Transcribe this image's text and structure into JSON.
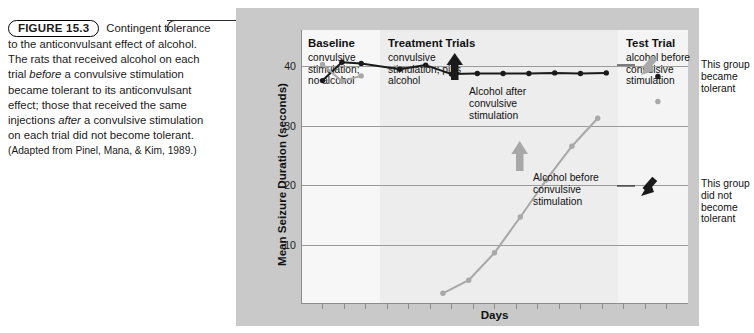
{
  "caption": {
    "figure_label": "FIGURE 15.3",
    "text_1": " Contingent tolerance to the anticonvulsant effect of alcohol. The rats that received alcohol on each trial ",
    "em_1": "before",
    "text_2": " a convulsive stimulation became tolerant to its anticonvulsant effect; those that received the same injections ",
    "em_2": "after",
    "text_3": " a convulsive stimulation on each trial did not become tolerant. ",
    "source": "(Adapted from Pinel, Mana, & Kim, 1989.)"
  },
  "columns": [
    {
      "heading": "Baseline",
      "subtext": "convulsive\nstimulation;\nno alcohol"
    },
    {
      "heading": "Treatment Trials",
      "subtext": "convulsive\nstimulation; plus\nalcohol"
    },
    {
      "heading": "Test Trial",
      "subtext": "alcohol before\nconvulsive\nstimulation"
    }
  ],
  "annotations": {
    "alcohol_after": "Alcohol after convulsive stimulation",
    "alcohol_before": "Alcohol before convulsive stimulation",
    "became_tolerant": "This group became tolerant",
    "not_tolerant": "This group did not become tolerant"
  },
  "colors": {
    "figure_background": "#c9c9c9",
    "panel_baseline": "#f7f7f7",
    "panel_treatment": "#ededed",
    "panel_test": "#f4f4f4",
    "series_after_stimulation": "#1a1a1a",
    "series_before_stimulation": "#a8a8a8",
    "gridline": "#9a9a9a",
    "axis": "#8c8c8c"
  },
  "chart_data": {
    "type": "line",
    "title": "",
    "xlabel": "Days",
    "ylabel": "Mean Seizure Duration (seconds)",
    "ylim": [
      0,
      46
    ],
    "yticks": [
      10,
      20,
      30,
      40
    ],
    "xlim": [
      0,
      18
    ],
    "grid": true,
    "legend": "none",
    "panels": [
      {
        "name": "Baseline",
        "x_start": 0,
        "x_end": 3.7
      },
      {
        "name": "Treatment Trials",
        "x_start": 3.7,
        "x_end": 14.8
      },
      {
        "name": "Test Trial",
        "x_start": 14.8,
        "x_end": 18
      }
    ],
    "series": [
      {
        "name": "Alcohol after convulsive stimulation",
        "color": "#1a1a1a",
        "marker": "circle",
        "points": [
          {
            "x": 1.0,
            "y": 37.5
          },
          {
            "x": 1.9,
            "y": 40.6
          },
          {
            "x": 2.8,
            "y": 40.4
          },
          {
            "x": 4.6,
            "y": 39.4
          },
          {
            "x": 5.8,
            "y": 40.1
          },
          {
            "x": 7.0,
            "y": 38.6
          },
          {
            "x": 8.2,
            "y": 38.7
          },
          {
            "x": 9.4,
            "y": 38.7
          },
          {
            "x": 10.6,
            "y": 38.7
          },
          {
            "x": 11.8,
            "y": 38.8
          },
          {
            "x": 13.0,
            "y": 38.7
          },
          {
            "x": 14.2,
            "y": 38.8
          },
          {
            "x": 16.6,
            "y": 38.2
          }
        ],
        "test_trial_point": {
          "x": 16.6,
          "y": 5.0
        }
      },
      {
        "name": "Alcohol before convulsive stimulation",
        "color": "#a8a8a8",
        "marker": "circle",
        "points": [
          {
            "x": 1.0,
            "y": 40.2
          },
          {
            "x": 1.9,
            "y": 37.4
          },
          {
            "x": 2.8,
            "y": 38.3
          },
          {
            "x": 6.6,
            "y": 1.8
          },
          {
            "x": 7.8,
            "y": 4.0
          },
          {
            "x": 9.0,
            "y": 8.6
          },
          {
            "x": 10.2,
            "y": 14.6
          },
          {
            "x": 11.4,
            "y": 20.8
          },
          {
            "x": 12.6,
            "y": 26.5
          },
          {
            "x": 13.8,
            "y": 31.2
          },
          {
            "x": 16.6,
            "y": 34.0
          }
        ],
        "test_trial_point": {
          "x": 16.6,
          "y": 34.0
        }
      }
    ]
  }
}
